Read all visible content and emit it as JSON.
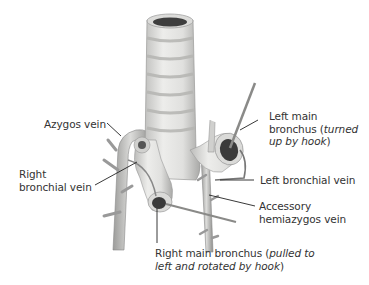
{
  "figure": {
    "labels": {
      "azygos_vein": "Azygos vein",
      "right_bronchial_vein_line1": "Right",
      "right_bronchial_vein_line2": "bronchial vein",
      "left_main_bronchus_line1": "Left main",
      "left_main_bronchus_line2_plain": "bronchus (",
      "left_main_bronchus_line2_italic": "turned",
      "left_main_bronchus_line3_italic": "up by hook",
      "left_main_bronchus_line3_plain": ")",
      "left_bronchial_vein": "Left bronchial vein",
      "accessory_hemiazygos_line1": "Accessory",
      "accessory_hemiazygos_line2": "hemiazygos vein",
      "right_main_bronchus_line1_plain": "Right main bronchus (",
      "right_main_bronchus_line1_italic": "pulled to",
      "right_main_bronchus_line2_italic": "left and rotated by hook",
      "right_main_bronchus_line2_plain": ")"
    },
    "colors": {
      "tissue": "#e4e4e2",
      "tissue_shadow": "#b8b8b6",
      "ring_band": "#c9c9c6",
      "lumen": "#3a3a3a",
      "leader_line": "#222222"
    }
  }
}
